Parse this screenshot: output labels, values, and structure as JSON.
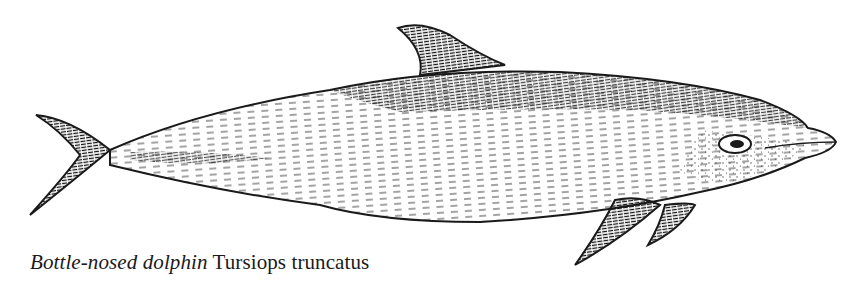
{
  "caption": {
    "common_name": "Bottle-nosed dolphin",
    "scientific_name": "Tursiops truncatus"
  },
  "illustration": {
    "subject": "dolphin-illustration",
    "style": "pen-and-ink line drawing",
    "ink_color": "#1a1a1a",
    "background_color": "#ffffff"
  }
}
